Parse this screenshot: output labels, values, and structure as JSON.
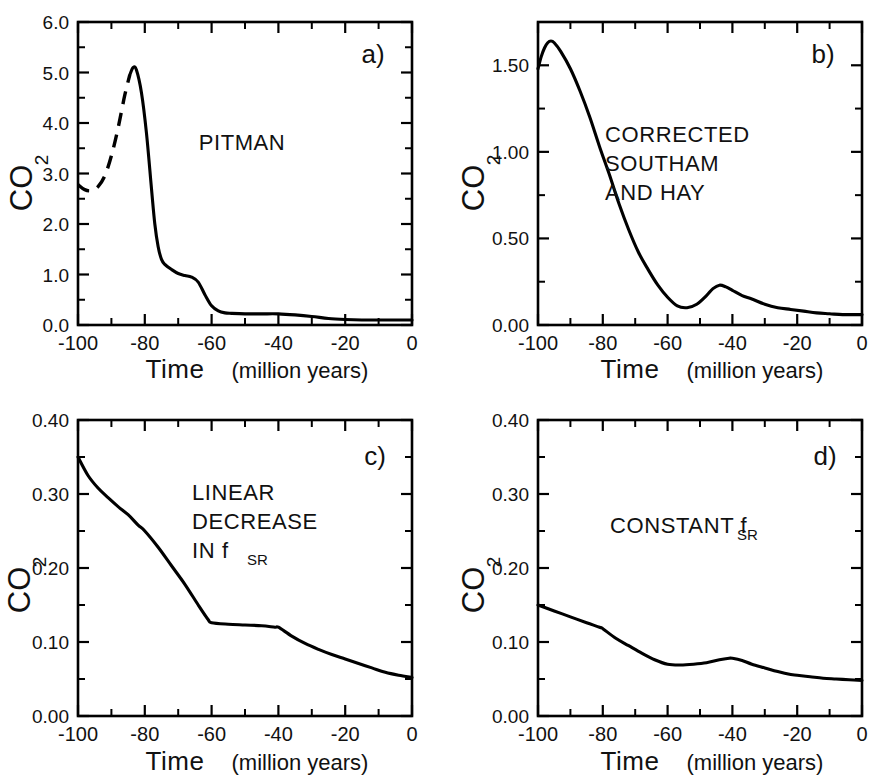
{
  "figure": {
    "shared": {
      "xlabel_main": "Time",
      "xlabel_paren": "(million years)",
      "ylabel": "CO",
      "ylabel_sub": "2",
      "x_tick_labels": [
        "-100",
        "-80",
        "-60",
        "-40",
        "-20",
        "0"
      ],
      "x_tick_values": [
        -100,
        -80,
        -60,
        -40,
        -20,
        0
      ],
      "line_color": "#000000",
      "background_color": "#ffffff"
    },
    "panels": [
      {
        "id": "a",
        "letter": "a)",
        "annotation_lines": [
          "PITMAN"
        ],
        "y_tick_labels": [
          "0.0",
          "1.0",
          "2.0",
          "3.0",
          "4.0",
          "5.0",
          "6.0"
        ],
        "y_tick_values": [
          0.0,
          1.0,
          2.0,
          3.0,
          4.0,
          5.0,
          6.0
        ]
      },
      {
        "id": "b",
        "letter": "b)",
        "annotation_lines": [
          "CORRECTED",
          "SOUTHAM",
          "AND HAY"
        ],
        "y_tick_labels": [
          "0.00",
          "0.50",
          "1.00",
          "1.50"
        ],
        "y_tick_values": [
          0.0,
          0.5,
          1.0,
          1.5
        ]
      },
      {
        "id": "c",
        "letter": "c)",
        "annotation_lines": [
          "LINEAR",
          "DECREASE",
          "IN f"
        ],
        "annotation_subscript": "SR",
        "y_tick_labels": [
          "0.00",
          "0.10",
          "0.20",
          "0.30",
          "0.40"
        ],
        "y_tick_values": [
          0.0,
          0.1,
          0.2,
          0.3,
          0.4
        ]
      },
      {
        "id": "d",
        "letter": "d)",
        "annotation_lines": [
          "CONSTANT f"
        ],
        "annotation_subscript": "SR",
        "y_tick_labels": [
          "0.00",
          "0.10",
          "0.20",
          "0.30",
          "0.40"
        ],
        "y_tick_values": [
          0.0,
          0.1,
          0.2,
          0.3,
          0.4
        ]
      }
    ]
  },
  "chart_data": [
    {
      "type": "line",
      "panel": "a",
      "title": "PITMAN",
      "xlabel": "Time (million years)",
      "ylabel": "CO2",
      "xlim": [
        -100,
        0
      ],
      "ylim": [
        0.0,
        6.0
      ],
      "xticks": [
        -100,
        -80,
        -60,
        -40,
        -20,
        0
      ],
      "yticks": [
        0.0,
        1.0,
        2.0,
        3.0,
        4.0,
        5.0,
        6.0
      ],
      "minor_xtick_interval": 10,
      "minor_ytick_interval": 0.5,
      "grid": false,
      "legend": false,
      "series": [
        {
          "name": "CO2 (dashed extrapolation)",
          "style": "dashed",
          "x": [
            -100,
            -98,
            -96,
            -94,
            -92,
            -90,
            -88,
            -86,
            -84.5
          ],
          "y": [
            2.78,
            2.68,
            2.66,
            2.74,
            2.95,
            3.35,
            3.9,
            4.55,
            4.95
          ]
        },
        {
          "name": "CO2 (solid)",
          "style": "solid",
          "x": [
            -84.5,
            -83.5,
            -82.5,
            -81,
            -79.5,
            -78,
            -77,
            -76,
            -75,
            -74,
            -72,
            -70,
            -68,
            -66,
            -64,
            -62,
            -60,
            -58,
            -56,
            -54,
            -50,
            -45,
            -40,
            -35,
            -30,
            -25,
            -20,
            -15,
            -10,
            -5,
            0
          ],
          "y": [
            4.95,
            5.1,
            5.05,
            4.6,
            3.8,
            2.7,
            2.0,
            1.55,
            1.3,
            1.2,
            1.1,
            1.02,
            0.98,
            0.95,
            0.85,
            0.6,
            0.38,
            0.28,
            0.24,
            0.23,
            0.22,
            0.22,
            0.22,
            0.2,
            0.17,
            0.13,
            0.11,
            0.1,
            0.1,
            0.1,
            0.1
          ]
        }
      ]
    },
    {
      "type": "line",
      "panel": "b",
      "title": "CORRECTED SOUTHAM AND HAY",
      "xlabel": "Time (million years)",
      "ylabel": "CO2",
      "xlim": [
        -100,
        0
      ],
      "ylim": [
        0.0,
        1.75
      ],
      "xticks": [
        -100,
        -80,
        -60,
        -40,
        -20,
        0
      ],
      "yticks": [
        0.0,
        0.5,
        1.0,
        1.5
      ],
      "minor_xtick_interval": 10,
      "minor_ytick_interval": 0.25,
      "grid": false,
      "legend": false,
      "series": [
        {
          "name": "CO2",
          "style": "solid",
          "x": [
            -100,
            -99,
            -98,
            -97,
            -96,
            -95,
            -93,
            -90,
            -87,
            -84,
            -81,
            -78,
            -75,
            -72,
            -69,
            -66,
            -63,
            -60,
            -57,
            -54,
            -51,
            -48,
            -46,
            -44,
            -42,
            -40,
            -37,
            -34,
            -30,
            -26,
            -22,
            -18,
            -14,
            -10,
            -6,
            -2,
            0
          ],
          "y": [
            1.48,
            1.55,
            1.6,
            1.63,
            1.64,
            1.63,
            1.58,
            1.48,
            1.35,
            1.2,
            1.03,
            0.87,
            0.7,
            0.55,
            0.42,
            0.32,
            0.23,
            0.16,
            0.11,
            0.1,
            0.12,
            0.17,
            0.21,
            0.23,
            0.22,
            0.2,
            0.17,
            0.15,
            0.12,
            0.1,
            0.09,
            0.08,
            0.07,
            0.065,
            0.06,
            0.06,
            0.06
          ]
        }
      ]
    },
    {
      "type": "line",
      "panel": "c",
      "title": "LINEAR DECREASE IN fSR",
      "xlabel": "Time (million years)",
      "ylabel": "CO2",
      "xlim": [
        -100,
        0
      ],
      "ylim": [
        0.0,
        0.4
      ],
      "xticks": [
        -100,
        -80,
        -60,
        -40,
        -20,
        0
      ],
      "yticks": [
        0.0,
        0.1,
        0.2,
        0.3,
        0.4
      ],
      "minor_xtick_interval": 10,
      "minor_ytick_interval": 0.05,
      "grid": false,
      "legend": false,
      "series": [
        {
          "name": "CO2",
          "style": "solid",
          "x": [
            -100,
            -97,
            -94,
            -91,
            -88,
            -85,
            -82,
            -80,
            -76,
            -72,
            -68,
            -64,
            -61,
            -60,
            -55,
            -50,
            -45,
            -41,
            -40,
            -36,
            -32,
            -28,
            -24,
            -20,
            -16,
            -12,
            -8,
            -4,
            0
          ],
          "y": [
            0.35,
            0.325,
            0.308,
            0.295,
            0.283,
            0.272,
            0.258,
            0.25,
            0.228,
            0.203,
            0.178,
            0.15,
            0.13,
            0.126,
            0.124,
            0.123,
            0.122,
            0.12,
            0.12,
            0.108,
            0.098,
            0.09,
            0.083,
            0.077,
            0.071,
            0.065,
            0.059,
            0.055,
            0.052
          ]
        }
      ]
    },
    {
      "type": "line",
      "panel": "d",
      "title": "CONSTANT fSR",
      "xlabel": "Time (million years)",
      "ylabel": "CO2",
      "xlim": [
        -100,
        0
      ],
      "ylim": [
        0.0,
        0.4
      ],
      "xticks": [
        -100,
        -80,
        -60,
        -40,
        -20,
        0
      ],
      "yticks": [
        0.0,
        0.1,
        0.2,
        0.3,
        0.4
      ],
      "minor_xtick_interval": 10,
      "minor_ytick_interval": 0.05,
      "grid": false,
      "legend": false,
      "series": [
        {
          "name": "CO2",
          "style": "solid",
          "x": [
            -100,
            -95,
            -90,
            -85,
            -81,
            -80,
            -76,
            -72,
            -68,
            -64,
            -60,
            -56,
            -52,
            -48,
            -44,
            -41,
            -40,
            -37,
            -34,
            -30,
            -26,
            -22,
            -20,
            -16,
            -12,
            -8,
            -4,
            0
          ],
          "y": [
            0.15,
            0.142,
            0.134,
            0.126,
            0.12,
            0.118,
            0.105,
            0.095,
            0.085,
            0.076,
            0.07,
            0.069,
            0.07,
            0.072,
            0.076,
            0.078,
            0.078,
            0.075,
            0.07,
            0.065,
            0.06,
            0.056,
            0.055,
            0.053,
            0.051,
            0.05,
            0.049,
            0.048
          ]
        }
      ]
    }
  ]
}
